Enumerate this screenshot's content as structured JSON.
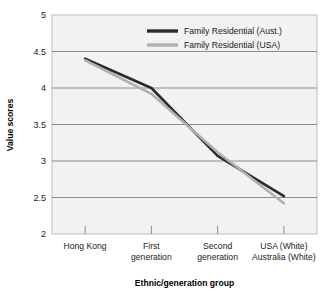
{
  "chart_data": {
    "type": "line",
    "title": "",
    "xlabel": "Ethnic/generation group",
    "ylabel": "Value scores",
    "categories": [
      "Hong Kong",
      "First generation",
      "Second generation",
      "USA (White) Australia (White)"
    ],
    "category_lines": [
      [
        "Hong Kong"
      ],
      [
        "First",
        "generation"
      ],
      [
        "Second",
        "generation"
      ],
      [
        "USA (White)",
        "Australia (White)"
      ]
    ],
    "series": [
      {
        "name": "Family Residential (Aust.)",
        "color": "#2b2b2b",
        "values": [
          4.4,
          4.0,
          3.07,
          2.52
        ]
      },
      {
        "name": "Family Residential (USA)",
        "color": "#b0b0b0",
        "values": [
          4.38,
          3.92,
          3.12,
          2.42
        ]
      }
    ],
    "ylim": [
      2,
      5
    ],
    "yticks": [
      2,
      2.5,
      3,
      3.5,
      4,
      4.5,
      5
    ],
    "ytick_labels": [
      "2",
      "2.5",
      "3",
      "3.5",
      "4",
      "4.5",
      "5"
    ],
    "grid": true,
    "grid_color": "#8c8c8c",
    "plot_background": "#f2f2f2",
    "legend_position": "top-right",
    "legend": [
      {
        "label": "Family Residential (Aust.)",
        "color": "#2b2b2b"
      },
      {
        "label": "Family Residential (USA)",
        "color": "#b0b0b0"
      }
    ]
  }
}
